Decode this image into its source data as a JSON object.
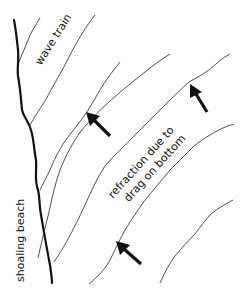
{
  "labels": {
    "wave_train": "wave train",
    "refraction_line1": "refraction due to",
    "refraction_line2": "drag on bottom",
    "shoaling_beach": "shoaling beach"
  },
  "colors": {
    "background": "#ffffff",
    "line": "#222222",
    "beach": "#111111",
    "arrow": "#111111"
  },
  "diagram": {
    "type": "wave refraction illustration",
    "wave_crest_count": 7,
    "arrow_count": 3,
    "arrow_direction": "up-left (toward beach)"
  }
}
